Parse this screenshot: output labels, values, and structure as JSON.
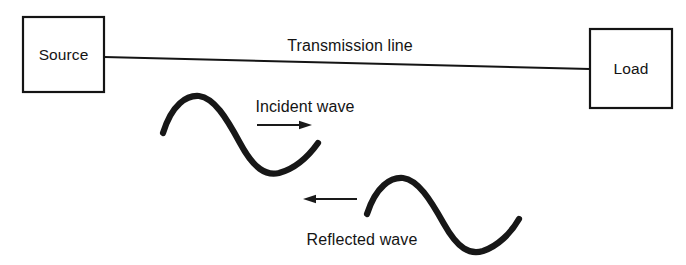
{
  "figure": {
    "background_color": "#ffffff",
    "ink_color": "#141414",
    "width": 686,
    "height": 265
  },
  "blocks": {
    "source": {
      "label": "Source",
      "x": 23,
      "y": 17,
      "width": 81,
      "height": 75
    },
    "load": {
      "label": "Load",
      "x": 590,
      "y": 29,
      "width": 82,
      "height": 79
    }
  },
  "transmission_line": {
    "label": "Transmission line",
    "label_x": 350,
    "label_y": 51,
    "start_x": 104,
    "start_y": 57,
    "end_x": 590,
    "end_y": 69
  },
  "waves": [
    {
      "name": "incident",
      "label": "Incident wave",
      "label_x": 305,
      "label_y": 112,
      "path": "M 163 133 C 172 104, 187 95, 199 96 C 214 98, 226 117, 240 143 C 254 169, 266 176, 279 173 C 294 169, 308 157, 318 143",
      "arrow": {
        "direction": "right",
        "x1": 257,
        "y1": 125,
        "x2": 312,
        "y2": 125
      }
    },
    {
      "name": "reflected",
      "label": "Reflected wave",
      "label_x": 362,
      "label_y": 245,
      "path": "M 367 214 C 376 186, 391 177, 403 178 C 418 180, 430 199, 444 224 C 458 249, 470 255, 483 251 C 498 246, 511 233, 519 219",
      "arrow": {
        "direction": "left",
        "x1": 357,
        "y1": 199,
        "x2": 303,
        "y2": 199
      }
    }
  ]
}
